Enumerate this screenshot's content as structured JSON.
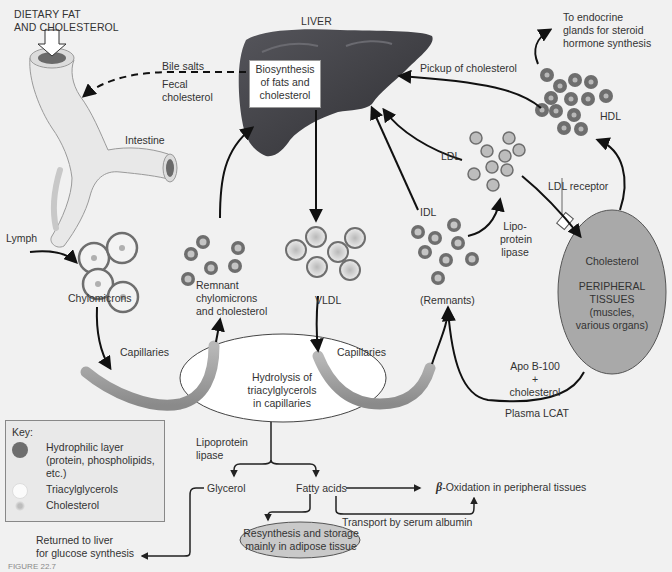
{
  "figure": {
    "caption_label": "FIGURE 22.7",
    "title_labels": {
      "dietary": [
        "DIETARY FAT",
        "AND CHOLESTEROL"
      ],
      "liver": "LIVER",
      "liver_box": [
        "Biosynthesis",
        "of fats and",
        "cholesterol"
      ]
    },
    "labels": {
      "bile_salts": "Bile salts",
      "fecal": [
        "Fecal",
        "cholesterol"
      ],
      "intestine": "Intestine",
      "lymph": "Lymph",
      "chylomicrons": "Chylomicrons",
      "remnant": [
        "Remnant",
        "chylomicrons",
        "and cholesterol"
      ],
      "vldl": "VLDL",
      "idl": "IDL",
      "remnants": "(Remnants)",
      "ldl": "LDL",
      "hdl": "HDL",
      "pickup": "Pickup of cholesterol",
      "endocrine": [
        "To endocrine",
        "glands for steroid",
        "hormone synthesis"
      ],
      "ldl_receptor": "LDL receptor",
      "lipo_lipase_right": [
        "Lipo-",
        "protein",
        "lipase"
      ],
      "cholesterol_tissue": "Cholesterol",
      "peripheral": [
        "PERIPHERAL",
        "TISSUES",
        "(muscles,",
        "various organs)"
      ],
      "apo": [
        "Apo B-100",
        "+",
        "cholesterol"
      ],
      "plasma_lcat": "Plasma LCAT",
      "capillaries_left": "Capillaries",
      "capillaries_right": "Capillaries",
      "hydrolysis": [
        "Hydrolysis of",
        "triacylglycerols",
        "in capillaries"
      ],
      "lipo_lipase_bottom": [
        "Lipoprotein",
        "lipase"
      ],
      "glycerol": "Glycerol",
      "fatty_acids": "Fatty acids",
      "beta_symbol": "β",
      "beta_oxidation": "-Oxidation in peripheral tissues",
      "transport": "Transport by serum albumin",
      "resynthesis": [
        "Resynthesis and storage",
        "mainly in adipose tissue"
      ],
      "returned": [
        "Returned to liver",
        "for glucose synthesis"
      ]
    },
    "key": {
      "title": "Key:",
      "items": [
        {
          "label": [
            "Hydrophilic layer",
            "(protein, phospholipids,",
            " etc.)"
          ],
          "swatch": "hydrophilic"
        },
        {
          "label": [
            "Triacylglycerols"
          ],
          "swatch": "triacylglycerol"
        },
        {
          "label": [
            "Cholesterol"
          ],
          "swatch": "cholesterol"
        }
      ]
    },
    "colors": {
      "background": "#f1f1f1",
      "liver": "#3f3f44",
      "hydrophilic": "#6e6e6e",
      "core_light": "#bcbcbc",
      "tissue": "#a9a9a9",
      "capillary": "#9c9c9c",
      "arrow": "#111111"
    }
  }
}
